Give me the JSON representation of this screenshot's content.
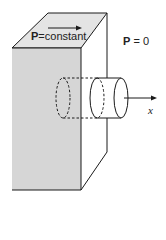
{
  "diagram": {
    "labels": {
      "top_label_symbol": "P",
      "top_label_rest": "=constant",
      "right_label_symbol": "P",
      "right_label_rest": " = 0",
      "axis_label": "x"
    },
    "colors": {
      "front_face": "#d6d6d6",
      "top_face": "#e4e4e4",
      "stroke": "#1a1a1a"
    }
  }
}
